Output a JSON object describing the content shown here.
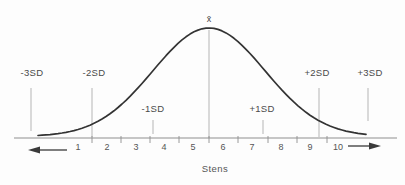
{
  "figure": {
    "mean_label": "x̄",
    "axis_title": "Stens",
    "sd_markers": {
      "neg3": "-3SD",
      "neg2": "-2SD",
      "neg1": "-1SD",
      "pos1": "+1SD",
      "pos2": "+2SD",
      "pos3": "+3SD"
    },
    "sten_labels": [
      "1",
      "2",
      "3",
      "4",
      "5",
      "6",
      "7",
      "8",
      "9",
      "10"
    ]
  },
  "chart_data": {
    "type": "line",
    "curve": "normal-distribution-bell",
    "title": "",
    "xlabel": "Stens",
    "ylabel": "",
    "x_ticks": [
      1,
      2,
      3,
      4,
      5,
      6,
      7,
      8,
      9,
      10
    ],
    "x_range_shown": [
      1,
      10
    ],
    "mean": {
      "label": "x̄",
      "sten": 5.5
    },
    "sd_in_stens": 2,
    "sd_markers": [
      {
        "label": "-3SD",
        "sten": -0.5
      },
      {
        "label": "-2SD",
        "sten": 1.5
      },
      {
        "label": "-1SD",
        "sten": 3.5
      },
      {
        "label": "+1SD",
        "sten": 7.5
      },
      {
        "label": "+2SD",
        "sten": 9.5
      },
      {
        "label": "+3SD",
        "sten": 11.5
      }
    ],
    "legend": null,
    "grid": false
  }
}
